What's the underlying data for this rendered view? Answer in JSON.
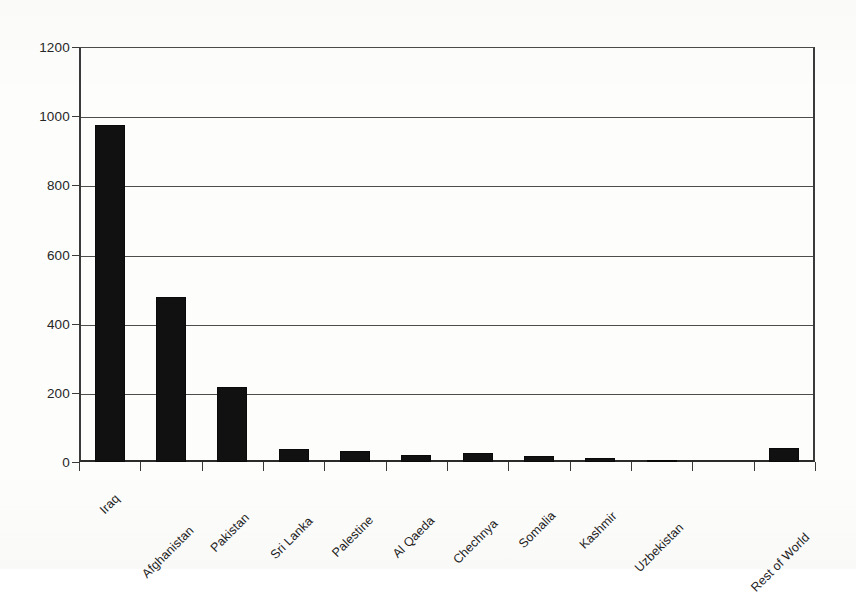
{
  "chart_data": {
    "type": "bar",
    "title": "",
    "subtitle": "",
    "xlabel": "",
    "ylabel": "",
    "ylim": [
      0,
      1200
    ],
    "ytick_interval": 200,
    "ytick_labels": [
      "0",
      "200",
      "400",
      "600",
      "800",
      "1000",
      "1200"
    ],
    "ytick_values": [
      0,
      200,
      400,
      600,
      800,
      1000,
      1200
    ],
    "grid": true,
    "grid_axis": "y",
    "legend": false,
    "legend_position": "none",
    "bar_color": "#111111",
    "axis_color": "#3a3a3a",
    "background_color": "#fdfdfc",
    "xtick_label_rotation": -45,
    "note_empty_slot_index": 10,
    "categories": [
      "Iraq",
      "Afghanistan",
      "Pakistan",
      "Sri Lanka",
      "Palestine",
      "Al Qaeda",
      "Chechnya",
      "Somalia",
      "Kashmir",
      "Uzbekistan",
      "",
      "Rest of World"
    ],
    "values": [
      975,
      478,
      218,
      38,
      32,
      20,
      27,
      18,
      11,
      5,
      0,
      40
    ]
  }
}
